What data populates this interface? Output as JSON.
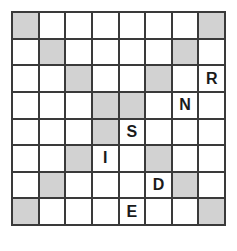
{
  "puzzle": {
    "title": "Shaded Diagonal Letter Grid",
    "type": "grid-puzzle",
    "rows": 8,
    "columns": 8,
    "colors": {
      "background": "#ffffff",
      "cell_empty": "#ffffff",
      "cell_shaded": "#d2d2d2",
      "grid_line": "#3a3a3a",
      "letter": "#1a1a1a"
    },
    "word": "RNSIDE",
    "letters": [
      {
        "row": 2,
        "col": 7,
        "label": "R"
      },
      {
        "row": 3,
        "col": 6,
        "label": "N"
      },
      {
        "row": 4,
        "col": 4,
        "label": "S"
      },
      {
        "row": 5,
        "col": 3,
        "label": "I"
      },
      {
        "row": 6,
        "col": 5,
        "label": "D"
      },
      {
        "row": 7,
        "col": 4,
        "label": "E"
      }
    ],
    "shaded_cells": [
      {
        "row": 0,
        "col": 0
      },
      {
        "row": 0,
        "col": 7
      },
      {
        "row": 1,
        "col": 1
      },
      {
        "row": 1,
        "col": 6
      },
      {
        "row": 2,
        "col": 2
      },
      {
        "row": 2,
        "col": 5
      },
      {
        "row": 3,
        "col": 3
      },
      {
        "row": 3,
        "col": 4
      },
      {
        "row": 4,
        "col": 3
      },
      {
        "row": 5,
        "col": 2
      },
      {
        "row": 5,
        "col": 5
      },
      {
        "row": 6,
        "col": 1
      },
      {
        "row": 6,
        "col": 6
      },
      {
        "row": 7,
        "col": 0
      },
      {
        "row": 7,
        "col": 7
      }
    ],
    "grid": [
      [
        {
          "shaded": true,
          "label": ""
        },
        {
          "shaded": false,
          "label": ""
        },
        {
          "shaded": false,
          "label": ""
        },
        {
          "shaded": false,
          "label": ""
        },
        {
          "shaded": false,
          "label": ""
        },
        {
          "shaded": false,
          "label": ""
        },
        {
          "shaded": false,
          "label": ""
        },
        {
          "shaded": true,
          "label": ""
        }
      ],
      [
        {
          "shaded": false,
          "label": ""
        },
        {
          "shaded": true,
          "label": ""
        },
        {
          "shaded": false,
          "label": ""
        },
        {
          "shaded": false,
          "label": ""
        },
        {
          "shaded": false,
          "label": ""
        },
        {
          "shaded": false,
          "label": ""
        },
        {
          "shaded": true,
          "label": ""
        },
        {
          "shaded": false,
          "label": ""
        }
      ],
      [
        {
          "shaded": false,
          "label": ""
        },
        {
          "shaded": false,
          "label": ""
        },
        {
          "shaded": true,
          "label": ""
        },
        {
          "shaded": false,
          "label": ""
        },
        {
          "shaded": false,
          "label": ""
        },
        {
          "shaded": true,
          "label": ""
        },
        {
          "shaded": false,
          "label": ""
        },
        {
          "shaded": false,
          "label": "R"
        }
      ],
      [
        {
          "shaded": false,
          "label": ""
        },
        {
          "shaded": false,
          "label": ""
        },
        {
          "shaded": false,
          "label": ""
        },
        {
          "shaded": true,
          "label": ""
        },
        {
          "shaded": true,
          "label": ""
        },
        {
          "shaded": false,
          "label": ""
        },
        {
          "shaded": false,
          "label": "N"
        },
        {
          "shaded": false,
          "label": ""
        }
      ],
      [
        {
          "shaded": false,
          "label": ""
        },
        {
          "shaded": false,
          "label": ""
        },
        {
          "shaded": false,
          "label": ""
        },
        {
          "shaded": true,
          "label": ""
        },
        {
          "shaded": false,
          "label": "S"
        },
        {
          "shaded": false,
          "label": ""
        },
        {
          "shaded": false,
          "label": ""
        },
        {
          "shaded": false,
          "label": ""
        }
      ],
      [
        {
          "shaded": false,
          "label": ""
        },
        {
          "shaded": false,
          "label": ""
        },
        {
          "shaded": true,
          "label": ""
        },
        {
          "shaded": false,
          "label": "I"
        },
        {
          "shaded": false,
          "label": ""
        },
        {
          "shaded": true,
          "label": ""
        },
        {
          "shaded": false,
          "label": ""
        },
        {
          "shaded": false,
          "label": ""
        }
      ],
      [
        {
          "shaded": false,
          "label": ""
        },
        {
          "shaded": true,
          "label": ""
        },
        {
          "shaded": false,
          "label": ""
        },
        {
          "shaded": false,
          "label": ""
        },
        {
          "shaded": false,
          "label": ""
        },
        {
          "shaded": false,
          "label": "D"
        },
        {
          "shaded": true,
          "label": ""
        },
        {
          "shaded": false,
          "label": ""
        }
      ],
      [
        {
          "shaded": true,
          "label": ""
        },
        {
          "shaded": false,
          "label": ""
        },
        {
          "shaded": false,
          "label": ""
        },
        {
          "shaded": false,
          "label": ""
        },
        {
          "shaded": false,
          "label": "E"
        },
        {
          "shaded": false,
          "label": ""
        },
        {
          "shaded": false,
          "label": ""
        },
        {
          "shaded": true,
          "label": ""
        }
      ]
    ]
  }
}
